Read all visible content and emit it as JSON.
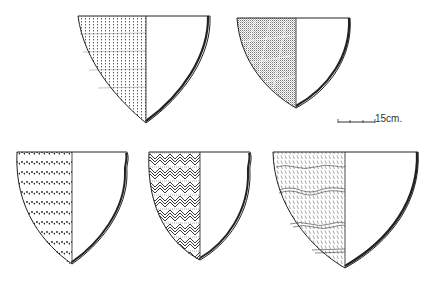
{
  "figure": {
    "type": "pottery-profile-plate",
    "vessels": [
      {
        "id": "vessel-1",
        "decoration": "vertical-dotted-lines",
        "rim": {
          "x1": 78,
          "x2": 210,
          "y": 16
        },
        "mid_x": 146,
        "tip": {
          "x": 145,
          "y": 123
        }
      },
      {
        "id": "vessel-2",
        "decoration": "fine-stipple-with-incised-grid",
        "rim": {
          "x1": 237,
          "x2": 350,
          "y": 18
        },
        "mid_x": 296,
        "tip": {
          "x": 296,
          "y": 108
        }
      },
      {
        "id": "vessel-3",
        "decoration": "horizontal-rows-of-dots",
        "rim": {
          "x1": 16,
          "x2": 127,
          "y": 152
        },
        "mid_x": 72,
        "tip": {
          "x": 70,
          "y": 264
        }
      },
      {
        "id": "vessel-4",
        "decoration": "herringbone-diagonal-hatching",
        "rim": {
          "x1": 148,
          "x2": 250,
          "y": 152
        },
        "mid_x": 200,
        "tip": {
          "x": 198,
          "y": 260
        }
      },
      {
        "id": "vessel-5",
        "decoration": "zoned-comb-impressed-wavy-bands",
        "rim": {
          "x1": 273,
          "x2": 418,
          "y": 152
        },
        "mid_x": 345,
        "tip": {
          "x": 344,
          "y": 268
        }
      }
    ],
    "scale_bar": {
      "label": "15cm.",
      "x1": 338,
      "x2": 375,
      "y": 122
    }
  }
}
